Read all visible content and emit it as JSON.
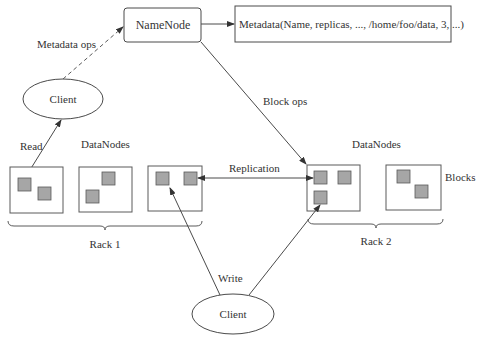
{
  "diagram": {
    "namenode": {
      "label": "NameNode"
    },
    "metadata": {
      "label": "Metadata(Name, replicas, ..., /home/foo/data, 3, ...)"
    },
    "client_top": {
      "label": "Client"
    },
    "client_bottom": {
      "label": "Client"
    },
    "edges": {
      "metadata_ops": "Metadata ops",
      "block_ops": "Block ops",
      "read": "Read",
      "write": "Write",
      "replication": "Replication"
    },
    "datanodes_left_label": "DataNodes",
    "datanodes_right_label": "DataNodes",
    "blocks_label": "Blocks",
    "racks": [
      {
        "label": "Rack 1",
        "datanodes": [
          {
            "blocks": 2
          },
          {
            "blocks": 2
          },
          {
            "blocks": 2
          }
        ]
      },
      {
        "label": "Rack 2",
        "datanodes": [
          {
            "blocks": 3
          },
          {
            "blocks": 2
          }
        ]
      }
    ],
    "colors": {
      "stroke": "#4a4a4a",
      "block_fill": "#a6a6a6",
      "block_stroke": "#5a5a5a",
      "background": "#ffffff"
    }
  }
}
